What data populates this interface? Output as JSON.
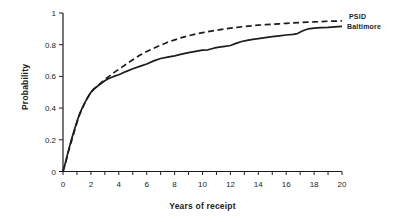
{
  "figure": {
    "background": "#ffffff",
    "ink_color": "#1c1c1c"
  },
  "chart_data": {
    "type": "line",
    "title": "",
    "xlabel": "Years of receipt",
    "ylabel": "Probability",
    "xlim": [
      0,
      20
    ],
    "ylim": [
      0,
      1
    ],
    "x_major_ticks": [
      0,
      2,
      4,
      6,
      8,
      10,
      12,
      14,
      16,
      18,
      20
    ],
    "x_minor_tick_step": 1,
    "y_ticks": [
      0,
      0.2,
      0.4,
      0.6,
      0.8,
      1
    ],
    "y_tick_labels": [
      "0",
      "0.2",
      "0.4",
      "0.6",
      "0.8",
      "1"
    ],
    "grid": false,
    "legend_position": "end-of-line-labels-right",
    "series": [
      {
        "name": "PSID",
        "style": "dashed",
        "color": "#1c1c1c",
        "points": [
          [
            0,
            0
          ],
          [
            0.2,
            0.06
          ],
          [
            0.4,
            0.13
          ],
          [
            0.6,
            0.19
          ],
          [
            0.8,
            0.25
          ],
          [
            1,
            0.31
          ],
          [
            1.2,
            0.36
          ],
          [
            1.4,
            0.4
          ],
          [
            1.6,
            0.44
          ],
          [
            1.8,
            0.47
          ],
          [
            2,
            0.5
          ],
          [
            2.2,
            0.52
          ],
          [
            2.4,
            0.535
          ],
          [
            2.6,
            0.55
          ],
          [
            2.8,
            0.565
          ],
          [
            3,
            0.58
          ],
          [
            3.25,
            0.597
          ],
          [
            3.5,
            0.613
          ],
          [
            3.75,
            0.63
          ],
          [
            4,
            0.645
          ],
          [
            4.5,
            0.675
          ],
          [
            5,
            0.705
          ],
          [
            5.5,
            0.733
          ],
          [
            6,
            0.757
          ],
          [
            6.5,
            0.778
          ],
          [
            7,
            0.797
          ],
          [
            7.5,
            0.815
          ],
          [
            8,
            0.83
          ],
          [
            8.5,
            0.845
          ],
          [
            9,
            0.857
          ],
          [
            9.5,
            0.867
          ],
          [
            10,
            0.876
          ],
          [
            10.5,
            0.884
          ],
          [
            11,
            0.891
          ],
          [
            11.5,
            0.898
          ],
          [
            12,
            0.904
          ],
          [
            12.5,
            0.91
          ],
          [
            13,
            0.915
          ],
          [
            13.5,
            0.919
          ],
          [
            14,
            0.923
          ],
          [
            14.5,
            0.926
          ],
          [
            15,
            0.929
          ],
          [
            15.5,
            0.932
          ],
          [
            16,
            0.935
          ],
          [
            16.5,
            0.938
          ],
          [
            17,
            0.94
          ],
          [
            17.5,
            0.942
          ],
          [
            18,
            0.944
          ],
          [
            18.5,
            0.946
          ],
          [
            19,
            0.948
          ],
          [
            19.5,
            0.949
          ],
          [
            20,
            0.95
          ]
        ]
      },
      {
        "name": "Baltimore",
        "style": "solid",
        "color": "#1c1c1c",
        "points": [
          [
            0,
            0
          ],
          [
            0.2,
            0.065
          ],
          [
            0.4,
            0.135
          ],
          [
            0.6,
            0.2
          ],
          [
            0.8,
            0.26
          ],
          [
            1,
            0.315
          ],
          [
            1.2,
            0.365
          ],
          [
            1.4,
            0.405
          ],
          [
            1.6,
            0.44
          ],
          [
            1.8,
            0.472
          ],
          [
            2,
            0.5
          ],
          [
            2.2,
            0.518
          ],
          [
            2.4,
            0.533
          ],
          [
            2.6,
            0.547
          ],
          [
            2.8,
            0.56
          ],
          [
            3,
            0.572
          ],
          [
            3.25,
            0.585
          ],
          [
            3.5,
            0.595
          ],
          [
            3.75,
            0.603
          ],
          [
            4,
            0.61
          ],
          [
            4.5,
            0.63
          ],
          [
            5,
            0.648
          ],
          [
            5.5,
            0.663
          ],
          [
            6,
            0.678
          ],
          [
            6.5,
            0.698
          ],
          [
            7,
            0.713
          ],
          [
            7.5,
            0.722
          ],
          [
            8,
            0.73
          ],
          [
            8.5,
            0.74
          ],
          [
            9,
            0.75
          ],
          [
            9.5,
            0.758
          ],
          [
            10,
            0.765
          ],
          [
            10.4,
            0.768
          ],
          [
            10.8,
            0.778
          ],
          [
            11.2,
            0.785
          ],
          [
            11.6,
            0.79
          ],
          [
            12,
            0.795
          ],
          [
            12.4,
            0.808
          ],
          [
            12.8,
            0.82
          ],
          [
            13.2,
            0.828
          ],
          [
            13.6,
            0.834
          ],
          [
            14,
            0.838
          ],
          [
            14.5,
            0.845
          ],
          [
            15,
            0.851
          ],
          [
            15.5,
            0.856
          ],
          [
            16,
            0.861
          ],
          [
            16.5,
            0.865
          ],
          [
            16.8,
            0.87
          ],
          [
            17.2,
            0.888
          ],
          [
            17.6,
            0.9
          ],
          [
            18,
            0.905
          ],
          [
            18.5,
            0.908
          ],
          [
            19,
            0.91
          ],
          [
            19.5,
            0.913
          ],
          [
            20,
            0.916
          ]
        ]
      }
    ],
    "plot_area_px": {
      "left": 63,
      "right": 342,
      "top": 13,
      "bottom": 171.5
    }
  }
}
